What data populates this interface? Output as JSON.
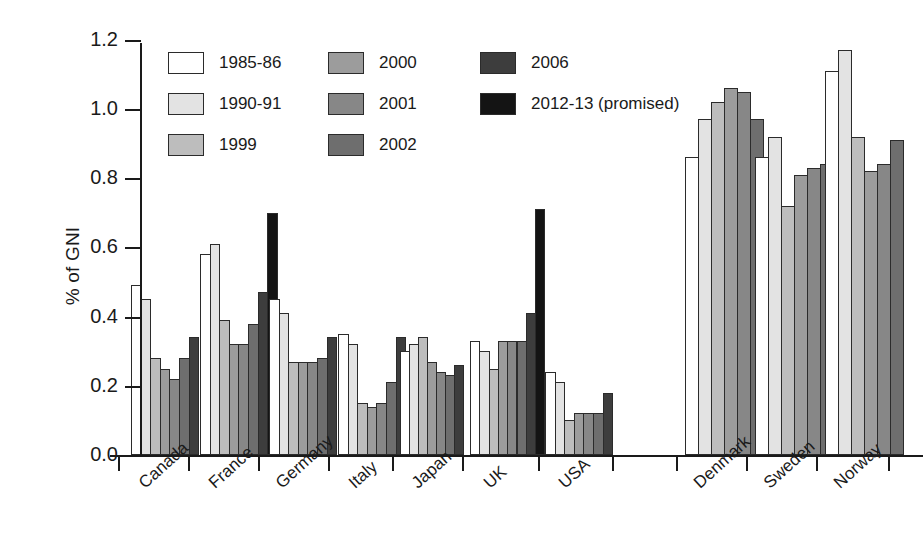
{
  "chart_data": {
    "type": "bar",
    "title": "",
    "xlabel": "",
    "ylabel": "% of GNI",
    "ylim": [
      0.0,
      1.2
    ],
    "ytick_labels": [
      "0.0",
      "0.2",
      "0.4",
      "0.6",
      "0.8",
      "1.0",
      "1.2"
    ],
    "ytick_values": [
      0.0,
      0.2,
      0.4,
      0.6,
      0.8,
      1.0,
      1.2
    ],
    "grid": false,
    "legend_position": "top-left inside axes",
    "categories": [
      "Canada",
      "France",
      "Germany",
      "Italy",
      "Japan",
      "UK",
      "USA",
      "Denmark",
      "Sweden",
      "Norway"
    ],
    "series": [
      {
        "name": "1985-86",
        "color": "#ffffff",
        "values": [
          0.49,
          0.58,
          0.45,
          0.35,
          0.3,
          0.33,
          0.24,
          0.86,
          0.86,
          1.11
        ]
      },
      {
        "name": "1990-91",
        "color": "#e3e3e3",
        "values": [
          0.45,
          0.61,
          0.41,
          0.32,
          0.32,
          0.3,
          0.21,
          0.97,
          0.92,
          1.17
        ]
      },
      {
        "name": "1999",
        "color": "#bdbdbd",
        "values": [
          0.28,
          0.39,
          0.27,
          0.15,
          0.34,
          0.25,
          0.1,
          1.02,
          0.72,
          0.92
        ]
      },
      {
        "name": "2000",
        "color": "#9c9c9c",
        "values": [
          0.25,
          0.32,
          0.27,
          0.14,
          0.27,
          0.33,
          0.12,
          1.06,
          0.81,
          0.82
        ]
      },
      {
        "name": "2001",
        "color": "#878787",
        "values": [
          0.22,
          0.32,
          0.27,
          0.15,
          0.24,
          0.33,
          0.12,
          1.05,
          0.83,
          0.84
        ]
      },
      {
        "name": "2002",
        "color": "#6e6e6e",
        "values": [
          0.28,
          0.38,
          0.28,
          0.21,
          0.23,
          0.33,
          0.12,
          0.97,
          0.84,
          0.91
        ]
      },
      {
        "name": "2006",
        "color": "#3d3d3d",
        "values": [
          0.34,
          0.47,
          0.34,
          0.34,
          0.26,
          0.41,
          0.18,
          null,
          null,
          null
        ]
      },
      {
        "name": "2012-13 (promised)",
        "color": "#141414",
        "values": [
          null,
          0.7,
          null,
          null,
          null,
          0.71,
          null,
          null,
          null,
          null
        ]
      }
    ]
  },
  "legend": {
    "columns": [
      {
        "items": [
          {
            "label": "1985-86",
            "swatch": "#ffffff"
          },
          {
            "label": "1990-91",
            "swatch": "#e3e3e3"
          },
          {
            "label": "1999",
            "swatch": "#bdbdbd"
          }
        ]
      },
      {
        "items": [
          {
            "label": "2000",
            "swatch": "#9c9c9c"
          },
          {
            "label": "2001",
            "swatch": "#878787"
          },
          {
            "label": "2002",
            "swatch": "#6e6e6e"
          }
        ]
      },
      {
        "items": [
          {
            "label": "2006",
            "swatch": "#3d3d3d"
          },
          {
            "label": "2012-13 (promised)",
            "swatch": "#141414"
          }
        ]
      }
    ]
  },
  "axes": {
    "y_title": "% of GNI"
  }
}
